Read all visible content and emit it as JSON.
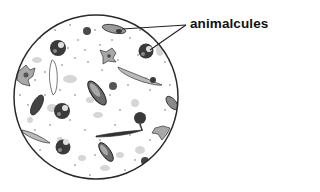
{
  "diagram": {
    "label": "animalcules",
    "colors": {
      "outline": "#2a2a2a",
      "organism_dark": "#3a3a3a",
      "organism_mid": "#8a8a8a",
      "organism_light": "#bdbdbd",
      "speck": "#555555",
      "background": "#ffffff"
    }
  }
}
